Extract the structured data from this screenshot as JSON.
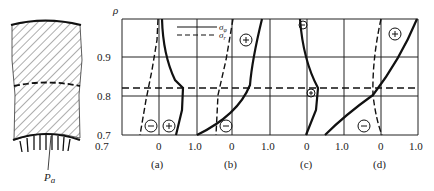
{
  "figure": {
    "axis_label": "ρ",
    "y_ticks": [
      "0.9",
      "0.8",
      "0.7"
    ],
    "pressure_label": "P",
    "pressure_subscript": "a",
    "legend": [
      {
        "style": "solid",
        "label": "σ",
        "sub": "φ"
      },
      {
        "style": "dashed",
        "label": "σ",
        "sub": "r"
      }
    ],
    "panels": [
      {
        "id": "a",
        "caption": "(a)",
        "x_ticks": [
          "0"
        ],
        "signs": [
          "⊖",
          "⊕"
        ]
      },
      {
        "id": "b",
        "caption": "(b)",
        "x_ticks": [
          "1.0",
          "0",
          "1.0"
        ],
        "signs": [
          "⊕",
          "⊖"
        ]
      },
      {
        "id": "c",
        "caption": "(c)",
        "x_ticks": [
          "0"
        ],
        "signs": [
          "⊖",
          "⊕"
        ]
      },
      {
        "id": "d",
        "caption": "(d)",
        "x_ticks": [
          "1.0",
          "0",
          "1.0"
        ],
        "signs": [
          "⊕",
          "⊖"
        ]
      }
    ],
    "interface_rho": "0.82",
    "colors": {
      "line": "#111111",
      "grid": "#222222"
    }
  }
}
